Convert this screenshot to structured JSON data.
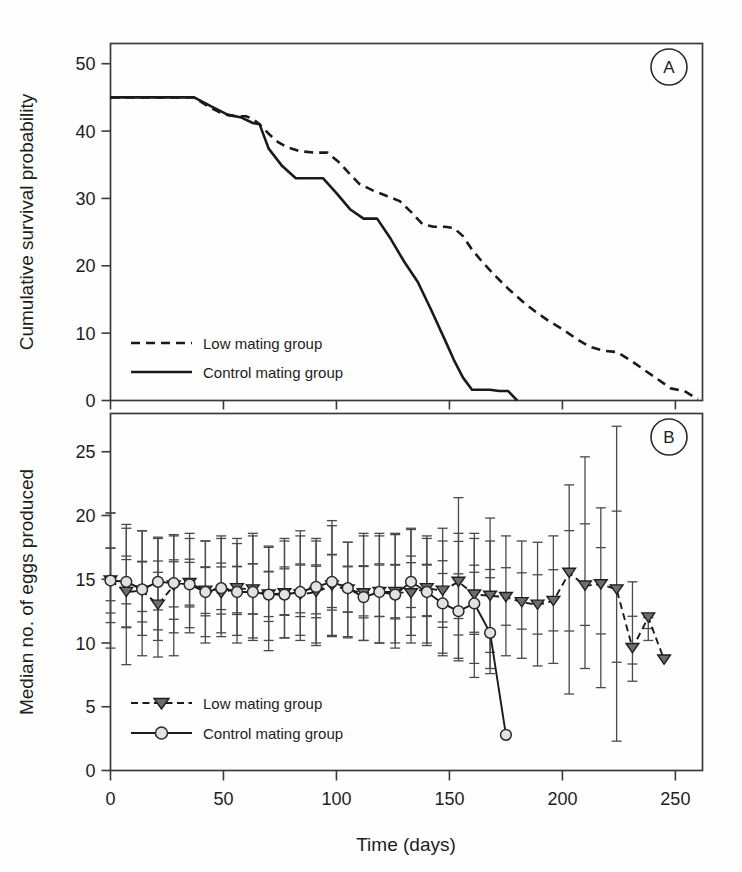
{
  "figure": {
    "panel_a_letter": "A",
    "panel_b_letter": "B",
    "xlabel": "Time (days)"
  },
  "chart_data": [
    {
      "type": "line",
      "panel": "A",
      "title": "",
      "xlabel": "Time (days)",
      "ylabel": "Cumulative survival probability",
      "xlim": [
        0,
        262
      ],
      "ylim": [
        0,
        53
      ],
      "xticks": [
        0,
        50,
        100,
        150,
        200,
        250
      ],
      "yticks": [
        0,
        10,
        20,
        30,
        40,
        50
      ],
      "grid": false,
      "legend_position": "lower-left",
      "series": [
        {
          "name": "Low mating group",
          "style": "dashed",
          "x": [
            0,
            37,
            44,
            50,
            56,
            60,
            63,
            66,
            70,
            74,
            78,
            84,
            90,
            96,
            101,
            106,
            110,
            116,
            122,
            128,
            133,
            138,
            143,
            148,
            152,
            156,
            160,
            165,
            170,
            176,
            182,
            188,
            194,
            200,
            206,
            212,
            218,
            224,
            230,
            236,
            242,
            248,
            254,
            260
          ],
          "y": [
            45,
            45,
            43.5,
            42.5,
            42.2,
            42.2,
            41.8,
            41.0,
            39.6,
            38.4,
            37.6,
            37.0,
            36.8,
            36.8,
            35.4,
            33.6,
            32.2,
            31.2,
            30.4,
            29.6,
            28.0,
            26.2,
            25.8,
            25.8,
            25.6,
            24.4,
            22.4,
            20.4,
            18.6,
            16.6,
            14.8,
            13.2,
            11.8,
            10.6,
            9.2,
            8.0,
            7.4,
            7.2,
            6.0,
            4.6,
            3.2,
            1.8,
            1.4,
            0.2
          ]
        },
        {
          "name": "Control mating group",
          "style": "solid",
          "x": [
            0,
            37,
            45,
            52,
            58,
            63,
            66,
            70,
            76,
            82,
            88,
            94,
            100,
            106,
            112,
            118,
            124,
            130,
            136,
            142,
            148,
            152,
            156,
            160,
            164,
            168,
            172,
            176,
            180
          ],
          "y": [
            45,
            45,
            43.6,
            42.4,
            42.0,
            41.2,
            41.0,
            37.4,
            34.8,
            33.0,
            33.0,
            33.0,
            30.8,
            28.4,
            27.0,
            27.0,
            24.0,
            20.6,
            17.6,
            13.4,
            9.0,
            6.0,
            3.4,
            1.6,
            1.6,
            1.6,
            1.4,
            1.4,
            0.0
          ]
        }
      ]
    },
    {
      "type": "line",
      "panel": "B",
      "title": "",
      "xlabel": "Time (days)",
      "ylabel": "Median no. of eggs produced",
      "xlim": [
        0,
        262
      ],
      "ylim": [
        0,
        28
      ],
      "xticks": [
        0,
        50,
        100,
        150,
        200,
        250
      ],
      "yticks": [
        0,
        5,
        10,
        15,
        20,
        25
      ],
      "grid": false,
      "legend_position": "lower-left",
      "error_bars": "interquartile range with inner quartile ticks",
      "series": [
        {
          "name": "Low mating group",
          "style": "dashed",
          "marker": "triangle-down",
          "x": [
            0,
            7,
            14,
            21,
            28,
            35,
            42,
            49,
            56,
            63,
            70,
            77,
            84,
            91,
            98,
            105,
            112,
            119,
            126,
            133,
            140,
            147,
            154,
            161,
            168,
            175,
            182,
            189,
            196,
            203,
            210,
            217,
            224,
            231,
            238,
            245
          ],
          "y": [
            14.9,
            14.0,
            14.1,
            13.0,
            14.5,
            14.7,
            14.1,
            13.9,
            14.3,
            14.2,
            13.8,
            13.9,
            13.8,
            14.0,
            14.5,
            14.2,
            13.9,
            14.0,
            14.0,
            13.9,
            14.3,
            14.1,
            14.8,
            13.8,
            13.7,
            13.6,
            13.2,
            13.0,
            13.3,
            15.5,
            14.5,
            14.6,
            14.2,
            9.6,
            12.0,
            8.7
          ],
          "err_low": [
            11.6,
            8.3,
            9.0,
            8.9,
            9.0,
            10.8,
            10.0,
            10.5,
            10.0,
            10.2,
            9.4,
            10.4,
            10.2,
            9.8,
            10.5,
            10.5,
            10.2,
            10.0,
            9.6,
            10.0,
            9.8,
            9.0,
            8.8,
            7.3,
            8.0,
            9.0,
            8.8,
            8.2,
            8.4,
            6.0,
            8.0,
            6.5,
            2.3,
            7.0,
            10.2,
            8.7
          ],
          "err_high": [
            20.2,
            19.3,
            18.8,
            18.3,
            18.4,
            18.6,
            18.0,
            18.2,
            17.8,
            18.4,
            17.5,
            18.2,
            18.8,
            18.2,
            19.6,
            17.9,
            18.4,
            18.6,
            18.5,
            18.9,
            18.2,
            19.0,
            21.4,
            18.6,
            18.0,
            18.4,
            18.0,
            17.9,
            18.4,
            22.4,
            24.6,
            20.6,
            27.0,
            14.8,
            12.0,
            8.7
          ]
        },
        {
          "name": "Control mating group",
          "style": "solid",
          "marker": "circle",
          "x": [
            0,
            7,
            14,
            21,
            28,
            35,
            42,
            49,
            56,
            63,
            70,
            77,
            84,
            91,
            98,
            105,
            112,
            119,
            126,
            133,
            140,
            147,
            154,
            161,
            168,
            175
          ],
          "y": [
            14.9,
            14.8,
            14.2,
            14.8,
            14.7,
            14.6,
            14.0,
            14.3,
            14.0,
            14.0,
            13.8,
            13.8,
            14.0,
            14.4,
            14.8,
            14.3,
            13.6,
            14.0,
            13.8,
            14.8,
            14.0,
            13.1,
            12.5,
            13.1,
            10.8,
            2.8
          ],
          "err_low": [
            9.6,
            11.2,
            10.6,
            10.2,
            10.8,
            11.2,
            10.5,
            10.8,
            10.6,
            10.4,
            10.2,
            10.4,
            10.6,
            10.0,
            10.6,
            10.4,
            10.2,
            10.0,
            10.0,
            10.6,
            10.0,
            9.2,
            8.6,
            8.4,
            7.6,
            2.8
          ],
          "err_high": [
            20.2,
            19.0,
            18.8,
            18.2,
            18.5,
            18.2,
            18.0,
            18.4,
            18.2,
            18.6,
            17.6,
            18.0,
            18.4,
            18.0,
            19.2,
            17.9,
            18.6,
            18.4,
            18.6,
            19.0,
            18.4,
            18.0,
            18.6,
            18.2,
            19.8,
            2.8
          ]
        }
      ]
    }
  ],
  "panel_a": {
    "ylabel": "Cumulative survival probability",
    "yticks": [
      "0",
      "10",
      "20",
      "30",
      "40",
      "50"
    ],
    "letter": "A",
    "legend": [
      {
        "label": "Low mating group",
        "style": "dashed"
      },
      {
        "label": "Control mating group",
        "style": "solid"
      }
    ]
  },
  "panel_b": {
    "ylabel": "Median no. of eggs produced",
    "yticks": [
      "0",
      "5",
      "10",
      "15",
      "20",
      "25"
    ],
    "letter": "B",
    "legend": [
      {
        "label": "Low mating group",
        "style": "dashed",
        "marker": "triangle-down"
      },
      {
        "label": "Control mating group",
        "style": "solid",
        "marker": "circle"
      }
    ]
  },
  "xaxis": {
    "label": "Time (days)",
    "ticks": [
      "0",
      "50",
      "100",
      "150",
      "200",
      "250"
    ]
  },
  "colors": {
    "line": "#1a1a1a",
    "frame": "#3a3a3a",
    "errorbar": "#4a4a4a",
    "circle_fill": "#e2e2e2",
    "triangle_fill": "#6e6e6e"
  }
}
